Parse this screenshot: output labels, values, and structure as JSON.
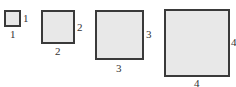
{
  "diagram": {
    "fill_color": "#e8e8e8",
    "border_color": "#3a3a3a",
    "squares": [
      {
        "side": "1",
        "right_label": "1",
        "bottom_label": "1"
      },
      {
        "side": "2",
        "right_label": "2",
        "bottom_label": "2"
      },
      {
        "side": "3",
        "right_label": "3",
        "bottom_label": "3"
      },
      {
        "side": "4",
        "right_label": "4",
        "bottom_label": "4"
      }
    ]
  }
}
